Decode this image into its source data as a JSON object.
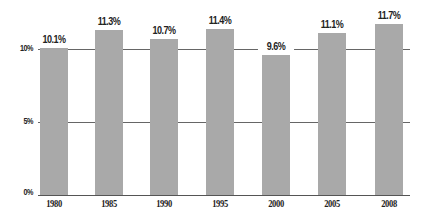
{
  "chart_data": {
    "type": "bar",
    "title": "",
    "xlabel": "",
    "ylabel": "",
    "categories": [
      "1980",
      "1985",
      "1990",
      "1995",
      "2000",
      "2005",
      "2008"
    ],
    "values": [
      10.1,
      11.3,
      10.7,
      11.4,
      9.6,
      11.1,
      11.7
    ],
    "value_labels": [
      "10.1%",
      "11.3%",
      "10.7%",
      "11.4%",
      "9.6%",
      "11.1%",
      "11.7%"
    ],
    "yticks": [
      {
        "value": 0,
        "label": "0%"
      },
      {
        "value": 5,
        "label": "5%"
      },
      {
        "value": 10,
        "label": "10%"
      }
    ],
    "ylim": [
      0,
      12
    ],
    "grid": true,
    "legend": null,
    "colors": {
      "bar": "#a9a9a9",
      "gridline": "#666666",
      "text": "#222222"
    }
  }
}
